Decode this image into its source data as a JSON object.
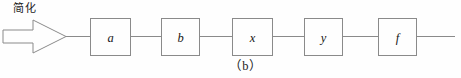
{
  "figure": {
    "caption": "（b）",
    "background_color": "#fefefe",
    "stroke_color": "#8a8a8a",
    "text_color": "#1b1b1b"
  },
  "annotation": {
    "simplify_label": "简化",
    "arrow_icon": "block-arrow-right-icon"
  },
  "chain": {
    "line_y": 36,
    "line_start_x": 66,
    "line_end_x": 455,
    "blocks": [
      {
        "letter": "a",
        "x": 90,
        "y": 18,
        "width": 40,
        "height": 38
      },
      {
        "letter": "b",
        "x": 161,
        "y": 18,
        "width": 38,
        "height": 38
      },
      {
        "letter": "x",
        "x": 232,
        "y": 18,
        "width": 40,
        "height": 38
      },
      {
        "letter": "y",
        "x": 304,
        "y": 18,
        "width": 38,
        "height": 38
      },
      {
        "letter": "f",
        "x": 378,
        "y": 18,
        "width": 38,
        "height": 38
      }
    ]
  }
}
